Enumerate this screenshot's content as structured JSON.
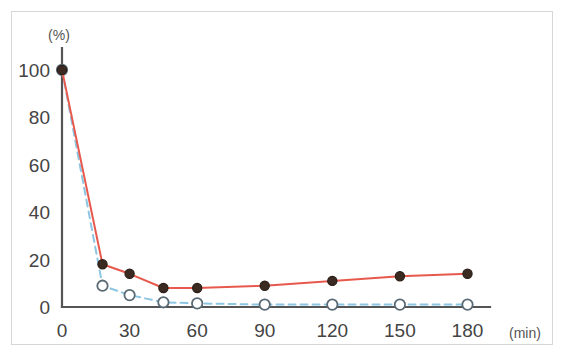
{
  "figure": {
    "background_color": "#ffffff",
    "frame_color": "#d6d6d6",
    "axis_color": "#555555"
  },
  "labels": {
    "y_unit": "(%)",
    "x_unit": "(min)",
    "y_ticks": [
      "0",
      "20",
      "40",
      "60",
      "80",
      "100"
    ],
    "x_ticks": [
      "0",
      "30",
      "60",
      "90",
      "120",
      "150",
      "180"
    ]
  },
  "chart_data": {
    "type": "line",
    "title": "",
    "xlabel": "(min)",
    "ylabel": "(%)",
    "xlim": [
      0,
      190
    ],
    "ylim": [
      0,
      105
    ],
    "xticks": [
      0,
      30,
      60,
      90,
      120,
      150,
      180
    ],
    "yticks": [
      0,
      20,
      40,
      60,
      80,
      100
    ],
    "grid": false,
    "legend": "none",
    "x": [
      0,
      18,
      30,
      45,
      60,
      90,
      120,
      150,
      180
    ],
    "series": [
      {
        "name": "solid-red-series",
        "color": "#e8594d",
        "line_style": "solid",
        "marker": "filled-circle",
        "marker_fill": "#3a2a22",
        "marker_edge": "#2b1d16",
        "values": [
          100,
          18,
          14,
          8,
          8,
          9,
          11,
          13,
          14
        ]
      },
      {
        "name": "dashed-blue-series",
        "color": "#8cc6e3",
        "line_style": "dashed",
        "marker": "open-circle",
        "marker_fill": "#ffffff",
        "marker_edge": "#5a6a74",
        "values": [
          100,
          9,
          5,
          2,
          1.5,
          1,
          1,
          1,
          1
        ]
      }
    ]
  }
}
